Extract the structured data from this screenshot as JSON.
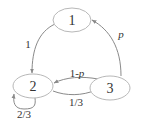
{
  "diagram": {
    "type": "markov-chain",
    "nodes": [
      {
        "id": "1",
        "label": "1"
      },
      {
        "id": "2",
        "label": "2"
      },
      {
        "id": "3",
        "label": "3"
      }
    ],
    "edges": [
      {
        "from": "1",
        "to": "2",
        "label": "1"
      },
      {
        "from": "3",
        "to": "1",
        "label": "p"
      },
      {
        "from": "3",
        "to": "2",
        "label_prefix": "1-",
        "label_var": "p"
      },
      {
        "from": "2",
        "to": "3",
        "label": "1/3"
      },
      {
        "from": "2",
        "to": "2",
        "label": "2/3"
      }
    ],
    "colors": {
      "node_stroke": "#b8b8b8",
      "edge_stroke": "#8a8a8a",
      "text": "#333333"
    }
  }
}
